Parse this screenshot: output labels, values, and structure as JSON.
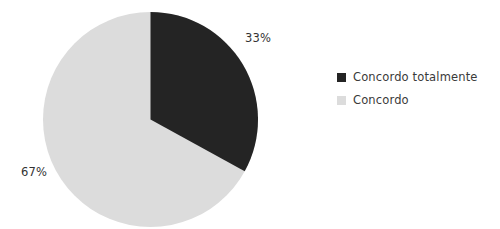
{
  "chart_data": {
    "type": "pie",
    "title": "",
    "subtitle": "",
    "xlabel": "",
    "ylabel": "",
    "grid": false,
    "legend_position": "right",
    "categories": [
      "Concordo totalmente",
      "Concordo"
    ],
    "values": [
      33,
      67
    ],
    "value_labels": [
      "33%",
      "67%"
    ],
    "units": "percent",
    "start_angle_deg": 0,
    "direction": "clockwise",
    "slices": [
      {
        "label": "Concordo totalmente",
        "value": 33,
        "value_label": "33%",
        "color": "#242424",
        "start_angle_deg": 0,
        "end_angle_deg": 118.8
      },
      {
        "label": "Concordo",
        "value": 67,
        "value_label": "67%",
        "color": "#dcdcdc",
        "start_angle_deg": 118.8,
        "end_angle_deg": 360
      }
    ],
    "legend": [
      {
        "label": "Concordo totalmente",
        "color": "#242424"
      },
      {
        "label": "Concordo",
        "color": "#dcdcdc"
      }
    ],
    "colors": {
      "background": "#ffffff",
      "series_dark": "#242424",
      "series_light": "#dcdcdc",
      "label_text": "#333333",
      "legend_text": "#3a3a3a"
    }
  }
}
